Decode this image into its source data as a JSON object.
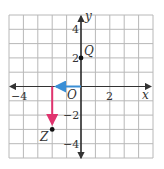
{
  "diagram": {
    "type": "coordinate-plane",
    "x_range": [
      -5,
      5
    ],
    "y_range": [
      -5,
      5
    ],
    "axis_labels": {
      "x": "x",
      "y": "y",
      "origin": "O"
    },
    "x_ticks": [
      {
        "value": -4,
        "label": "−4"
      },
      {
        "value": 2,
        "label": "2"
      }
    ],
    "y_ticks": [
      {
        "value": 4,
        "label": "4"
      },
      {
        "value": 2,
        "label": "2"
      },
      {
        "value": -2,
        "label": "−2"
      },
      {
        "value": -4,
        "label": "−4"
      }
    ],
    "points": [
      {
        "name": "Q",
        "x": 0,
        "y": 2
      },
      {
        "name": "Z",
        "x": -3,
        "y": -3
      }
    ],
    "vectors": [
      {
        "from": [
          0,
          0
        ],
        "to": [
          -3,
          0
        ],
        "color": "#3a8fd6",
        "name": "horizontal-move"
      },
      {
        "from": [
          -3,
          0
        ],
        "to": [
          -3,
          -3
        ],
        "color": "#e0336e",
        "name": "vertical-move"
      }
    ],
    "colors": {
      "grid": "#b8b8b8",
      "axis": "#333333",
      "blue": "#3a8fd6",
      "pink": "#e0336e"
    }
  }
}
